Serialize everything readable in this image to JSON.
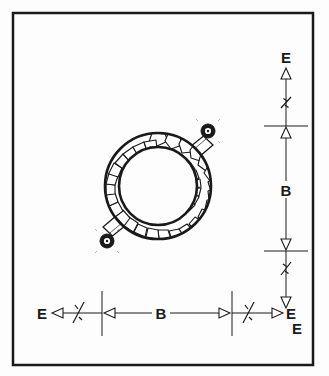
{
  "figure": {
    "kind": "engineering-section-drawing",
    "background_color": "#fdfdfd",
    "line_color": "#1a1a1a",
    "border": {
      "name": "figure-border",
      "x": 13,
      "y": 13,
      "width": 300,
      "height": 352,
      "stroke_width": 2.5
    }
  },
  "ring": {
    "name": "annular-ring-section",
    "center_x": 158,
    "center_y": 186,
    "outer_radius": 53,
    "inner_radius": 39,
    "hatch_style": "rubble-masonry-polygons",
    "fill_color": "#ffffff",
    "stroke_color": "#1a1a1a"
  },
  "lugs": [
    {
      "name": "lug-upper-right",
      "angle_deg": 45,
      "boss_center_x": 208,
      "boss_center_y": 131,
      "boss_radius": 6.5,
      "boss_fill": "#1a1a1a"
    },
    {
      "name": "lug-lower-left",
      "angle_deg": 225,
      "boss_center_x": 107,
      "boss_center_y": 241,
      "boss_radius": 6.5,
      "boss_fill": "#1a1a1a"
    }
  ],
  "vertical_dimension": {
    "name": "vertical-dimension-stack",
    "axis_x": 286,
    "top_label": "E",
    "middle_label": "B",
    "bottom_label": "E",
    "top_label_y": 58,
    "middle_label_y": 191,
    "bottom_label_y": 322,
    "extension_line_upper_y": 126,
    "extension_line_lower_y": 251,
    "extension_line_x1": 264,
    "extension_line_x2": 308,
    "arrow_top_y": 70,
    "arrow_bottom_y": 307,
    "break_upper_y": 103,
    "break_lower_y": 268
  },
  "horizontal_dimension": {
    "name": "horizontal-dimension-stack",
    "axis_y": 313,
    "left_label": "E",
    "middle_label": "B",
    "right_label": "E",
    "left_label_x": 42,
    "middle_label_x": 160,
    "right_label_x": 299,
    "extension_line_left_x": 102,
    "extension_line_right_x": 232,
    "extension_line_y1": 291,
    "extension_line_y2": 336,
    "arrow_left_x": 57,
    "arrow_right_x": 281,
    "break_left_x": 78,
    "break_right_x": 255
  },
  "labels": {
    "E": "E",
    "B": "B"
  }
}
